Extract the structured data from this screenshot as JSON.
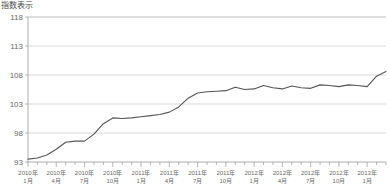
{
  "chart_data": {
    "type": "line",
    "title": "指数表示",
    "xlabel": "",
    "ylabel": "",
    "ylim": [
      93,
      118
    ],
    "yticks": [
      93,
      98,
      103,
      108,
      113,
      118
    ],
    "grid": true,
    "legend": "none",
    "x_tick_labels": [
      {
        "index": 0,
        "line1": "2010年",
        "line2": "1月"
      },
      {
        "index": 3,
        "line1": "2010年",
        "line2": "4月"
      },
      {
        "index": 6,
        "line1": "2010年",
        "line2": "7月"
      },
      {
        "index": 9,
        "line1": "2010年",
        "line2": "10月"
      },
      {
        "index": 12,
        "line1": "2011年",
        "line2": "1月"
      },
      {
        "index": 15,
        "line1": "2011年",
        "line2": "4月"
      },
      {
        "index": 18,
        "line1": "2011年",
        "line2": "7月"
      },
      {
        "index": 21,
        "line1": "2011年",
        "line2": "10月"
      },
      {
        "index": 24,
        "line1": "2012年",
        "line2": "1月"
      },
      {
        "index": 27,
        "line1": "2012年",
        "line2": "4月"
      },
      {
        "index": 30,
        "line1": "2012年",
        "line2": "7月"
      },
      {
        "index": 33,
        "line1": "2012年",
        "line2": "10月"
      },
      {
        "index": 36,
        "line1": "2013年",
        "line2": "1月"
      }
    ],
    "x": [
      "2010年1月",
      "2010年2月",
      "2010年3月",
      "2010年4月",
      "2010年5月",
      "2010年6月",
      "2010年7月",
      "2010年8月",
      "2010年9月",
      "2010年10月",
      "2010年11月",
      "2010年12月",
      "2011年1月",
      "2011年2月",
      "2011年3月",
      "2011年4月",
      "2011年5月",
      "2011年6月",
      "2011年7月",
      "2011年8月",
      "2011年9月",
      "2011年10月",
      "2011年11月",
      "2011年12月",
      "2012年1月",
      "2012年2月",
      "2012年3月",
      "2012年4月",
      "2012年5月",
      "2012年6月",
      "2012年7月",
      "2012年8月",
      "2012年9月",
      "2012年10月",
      "2012年11月",
      "2012年12月",
      "2013年1月",
      "2013年2月",
      "2013年3月"
    ],
    "series": [
      {
        "name": "指数",
        "color": "#555555",
        "values": [
          93.5,
          93.7,
          94.2,
          95.2,
          96.4,
          96.6,
          96.6,
          97.8,
          99.6,
          100.6,
          100.5,
          100.6,
          100.8,
          101.0,
          101.2,
          101.6,
          102.5,
          104.0,
          104.9,
          105.1,
          105.2,
          105.3,
          105.9,
          105.5,
          105.6,
          106.2,
          105.8,
          105.6,
          106.1,
          105.8,
          105.7,
          106.3,
          106.2,
          106.0,
          106.3,
          106.2,
          106.0,
          107.8,
          108.6
        ]
      }
    ],
    "extra_points": {
      "note": "monthly index series",
      "end_value": 108.8
    }
  },
  "plot_geometry": {
    "left": 28,
    "right": 386,
    "top": 17,
    "bottom": 162
  }
}
